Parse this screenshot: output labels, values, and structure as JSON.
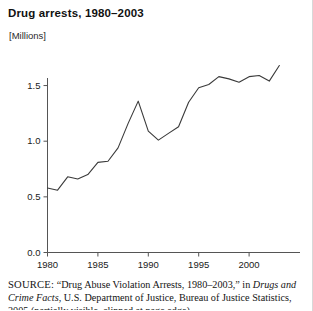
{
  "figure": {
    "title": "Drug arrests, 1980–2003",
    "unit_label": "[Millions]"
  },
  "source": {
    "label": "SOURCE:",
    "line1_a": " “Drug Abuse Violation Arrests, 1980–2003,” in ",
    "line1_italic": "Drugs and",
    "line2_italic": "Crime Facts",
    "line2_b": ", U.S. Department of Justice, Bureau of Justice Statistics,",
    "line3": "2005 (partially visible, clipped at page edge)"
  },
  "chart_data": {
    "type": "line",
    "title": "Drug arrests, 1980–2003",
    "xlabel": "",
    "ylabel": "[Millions]",
    "xlim": [
      1980,
      2003
    ],
    "ylim": [
      0.0,
      1.75
    ],
    "yticks": [
      "0.0",
      "0.5",
      "1.0",
      "1.5"
    ],
    "ytick_values": [
      0.0,
      0.5,
      1.0,
      1.5
    ],
    "xticks": [
      "1980",
      "1985",
      "1990",
      "1995",
      "2000"
    ],
    "xtick_values": [
      1980,
      1985,
      1990,
      1995,
      2000
    ],
    "grid": false,
    "legend": null,
    "x": [
      1980,
      1981,
      1982,
      1983,
      1984,
      1985,
      1986,
      1987,
      1988,
      1989,
      1990,
      1991,
      1992,
      1993,
      1994,
      1995,
      1996,
      1997,
      1998,
      1999,
      2000,
      2001,
      2002,
      2003
    ],
    "values": [
      0.58,
      0.56,
      0.68,
      0.66,
      0.7,
      0.81,
      0.82,
      0.94,
      1.16,
      1.36,
      1.09,
      1.01,
      1.07,
      1.13,
      1.35,
      1.48,
      1.51,
      1.58,
      1.56,
      1.53,
      1.58,
      1.59,
      1.54,
      1.68
    ],
    "series": [
      {
        "name": "Drug arrests",
        "values": [
          0.58,
          0.56,
          0.68,
          0.66,
          0.7,
          0.81,
          0.82,
          0.94,
          1.16,
          1.36,
          1.09,
          1.01,
          1.07,
          1.13,
          1.35,
          1.48,
          1.51,
          1.58,
          1.56,
          1.53,
          1.58,
          1.59,
          1.54,
          1.68
        ],
        "color": "#3a3a3a"
      }
    ]
  },
  "style": {
    "line_color": "#3a3a3a",
    "axis_color": "#555555",
    "text_color": "#111111",
    "background": "#ffffff"
  }
}
